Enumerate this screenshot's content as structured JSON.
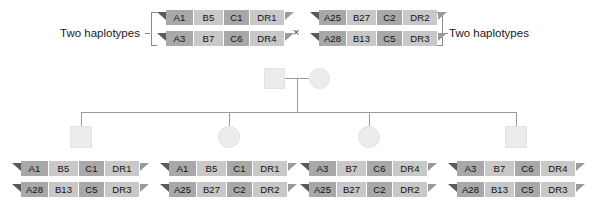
{
  "figure": {
    "type": "pedigree-haplotype-diagram",
    "cross_symbol": "×",
    "loci_order": [
      "A",
      "B",
      "C",
      "DR"
    ],
    "colors": {
      "cell_dark": "#a8a8a8",
      "cell_light": "#c8c8c8",
      "cap_left": "#5a5a5a",
      "cap_right": "#9a9a9a",
      "pedigree_symbol": "#ececec",
      "pedigree_line": "#9c9c9c",
      "text": "#111111",
      "background": "#ffffff"
    }
  },
  "labels": {
    "father_bracket": "Two haplotypes",
    "mother_bracket": "Two haplotypes"
  },
  "parents": {
    "father": {
      "symbol": "square",
      "haplotypes": [
        {
          "name": "a",
          "alleles": [
            "A1",
            "B5",
            "C1",
            "DR1"
          ]
        },
        {
          "name": "b",
          "alleles": [
            "A3",
            "B7",
            "C6",
            "DR4"
          ]
        }
      ]
    },
    "mother": {
      "symbol": "circle",
      "haplotypes": [
        {
          "name": "c",
          "alleles": [
            "A25",
            "B27",
            "C2",
            "DR2"
          ]
        },
        {
          "name": "d",
          "alleles": [
            "A28",
            "B13",
            "C5",
            "DR3"
          ]
        }
      ]
    }
  },
  "children": [
    {
      "index": 1,
      "symbol": "square",
      "genotype": "ad",
      "haplotypes": [
        {
          "name": "a",
          "alleles": [
            "A1",
            "B5",
            "C1",
            "DR1"
          ]
        },
        {
          "name": "d",
          "alleles": [
            "A28",
            "B13",
            "C5",
            "DR3"
          ]
        }
      ]
    },
    {
      "index": 2,
      "symbol": "circle",
      "genotype": "ac",
      "haplotypes": [
        {
          "name": "a",
          "alleles": [
            "A1",
            "B5",
            "C1",
            "DR1"
          ]
        },
        {
          "name": "c",
          "alleles": [
            "A25",
            "B27",
            "C2",
            "DR2"
          ]
        }
      ]
    },
    {
      "index": 3,
      "symbol": "circle",
      "genotype": "bc",
      "haplotypes": [
        {
          "name": "b",
          "alleles": [
            "A3",
            "B7",
            "C6",
            "DR4"
          ]
        },
        {
          "name": "c",
          "alleles": [
            "A25",
            "B27",
            "C2",
            "DR2"
          ]
        }
      ]
    },
    {
      "index": 4,
      "symbol": "square",
      "genotype": "bd",
      "haplotypes": [
        {
          "name": "b",
          "alleles": [
            "A3",
            "B7",
            "C6",
            "DR4"
          ]
        },
        {
          "name": "d",
          "alleles": [
            "A28",
            "B13",
            "C5",
            "DR3"
          ]
        }
      ]
    }
  ]
}
